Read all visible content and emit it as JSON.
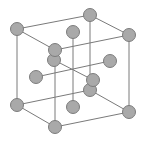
{
  "diagram": {
    "type": "face-centered-cubic-lattice",
    "colors": {
      "background": "#ffffff",
      "edge": "#7a7a7a",
      "atom_fill": "#a9a9a9",
      "atom_stroke": "#7c7c7c"
    },
    "atom_radius": 6.5,
    "nodes": {
      "tbl": [
        17,
        29
      ],
      "tbr": [
        90,
        15
      ],
      "tfr": [
        129,
        35
      ],
      "tfl": [
        55,
        50
      ],
      "bbl": [
        17,
        105
      ],
      "bbr": [
        90,
        90
      ],
      "bfr": [
        129,
        112
      ],
      "bfl": [
        55,
        127
      ],
      "top_c": [
        73,
        32
      ],
      "bottom_c": [
        73,
        107
      ],
      "left_c": [
        36,
        77
      ],
      "right_c": [
        110,
        61
      ],
      "back_c": [
        54,
        60
      ],
      "front_c": [
        93,
        80
      ]
    },
    "edges": [
      [
        "tbl",
        "tbr"
      ],
      [
        "tbr",
        "tfr"
      ],
      [
        "tfr",
        "tfl"
      ],
      [
        "tfl",
        "tbl"
      ],
      [
        "bbl",
        "bbr"
      ],
      [
        "bbr",
        "bfr"
      ],
      [
        "bfr",
        "bfl"
      ],
      [
        "bfl",
        "bbl"
      ],
      [
        "tbl",
        "bbl"
      ],
      [
        "tbr",
        "bbr"
      ],
      [
        "tfr",
        "bfr"
      ],
      [
        "tfl",
        "bfl"
      ],
      [
        "top_c",
        "bottom_c"
      ],
      [
        "left_c",
        "right_c"
      ],
      [
        "back_c",
        "front_c"
      ]
    ],
    "draw_order": [
      "tbr",
      "bbr",
      "back_c",
      "top_c",
      "bottom_c",
      "right_c",
      "left_c",
      "tbl",
      "bbl",
      "front_c",
      "tfl",
      "tfr",
      "bfr",
      "bfl"
    ]
  }
}
